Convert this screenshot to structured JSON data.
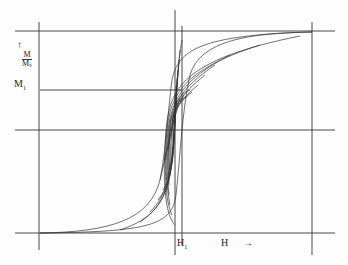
{
  "diagram": {
    "type": "magnetization hysteresis loops (family of minor loops)",
    "labels": {
      "y_arrow": "↑",
      "y_num": "M",
      "y_den": "Mₛ",
      "m1": "M",
      "m1_sub": "1",
      "h1": "H",
      "h1_sub": "1",
      "h_axis": "H",
      "h_arrow": "→"
    },
    "colors": {
      "line": "#333333",
      "background": "#fdfdfd"
    }
  }
}
